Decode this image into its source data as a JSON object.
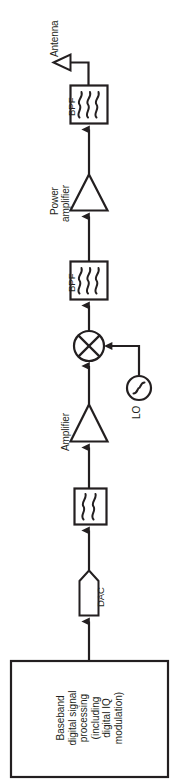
{
  "diagram": {
    "orientation": "vertical-upward signal flow",
    "stroke_color": "#231f20",
    "background_color": "#ffffff",
    "labels": {
      "antenna": "Antenna",
      "bpf_top": "BPF",
      "power_amplifier_line1": "Power",
      "power_amplifier_line2": "amplifier",
      "bpf_mid": "BPF",
      "lo": "LO",
      "amplifier": "Amplifier",
      "dac": "DAC"
    },
    "baseband": {
      "lines": [
        "Baseband",
        "digital signal",
        "processing",
        "(including",
        "digital IQ",
        "modulation)"
      ]
    },
    "blocks": [
      {
        "name": "antenna",
        "shape": "triangle-left",
        "label": "Antenna"
      },
      {
        "name": "bpf-top",
        "shape": "square-filter",
        "label": "BPF"
      },
      {
        "name": "power-amplifier",
        "shape": "triangle-up",
        "label": "Power amplifier"
      },
      {
        "name": "bpf-mid",
        "shape": "square-filter",
        "label": "BPF"
      },
      {
        "name": "mixer",
        "shape": "circle-cross",
        "label": ""
      },
      {
        "name": "local-oscillator",
        "shape": "circle-sine",
        "label": "LO"
      },
      {
        "name": "amplifier",
        "shape": "triangle-up",
        "label": "Amplifier"
      },
      {
        "name": "lpf",
        "shape": "square-filter",
        "label": ""
      },
      {
        "name": "dac",
        "shape": "pentagon",
        "label": "DAC"
      },
      {
        "name": "baseband-processing",
        "shape": "rectangle",
        "label": "Baseband digital signal processing (including digital IQ modulation)"
      }
    ]
  }
}
